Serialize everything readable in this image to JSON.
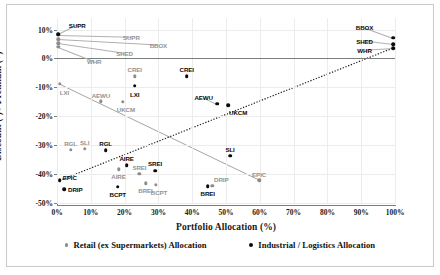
{
  "chart_data": {
    "type": "scatter",
    "title": "",
    "xlabel": "Portfolio Allocation (%)",
    "ylabel": "Discount (-) / Premium (+)",
    "xlim": [
      0,
      100
    ],
    "ylim": [
      -50,
      14
    ],
    "xticks": [
      "0%",
      "10%",
      "20%",
      "30%",
      "40%",
      "50%",
      "60%",
      "70%",
      "80%",
      "90%",
      "100%"
    ],
    "xtick_values": [
      0,
      10,
      20,
      30,
      40,
      50,
      60,
      70,
      80,
      90,
      100
    ],
    "yticks": [
      "10%",
      "0%",
      "-10%",
      "-20%",
      "-30%",
      "-40%",
      "-50%"
    ],
    "ytick_values": [
      10,
      0,
      -10,
      -20,
      -30,
      -40,
      -50
    ],
    "grid": true,
    "legend_position": "bottom",
    "series": [
      {
        "name": "Retail (ex Supermarkets) Allocation",
        "color": "#8c8c8c",
        "marker": "circle-grey",
        "points": [
          {
            "label": "SUPR",
            "x": 0.4,
            "y": 8.2,
            "lx": 22,
            "ly": 7.6
          },
          {
            "label": "BBOX",
            "x": 0.4,
            "y": 6.6,
            "lx": 30,
            "ly": 4.7
          },
          {
            "label": "SHED",
            "x": 0.4,
            "y": 5.2,
            "lx": 20,
            "ly": 1.8
          },
          {
            "label": "WHR",
            "x": 0.4,
            "y": 4.0,
            "lx": 11,
            "ly": -0.9
          },
          {
            "label": "LXI",
            "x": 0.8,
            "y": -8.8,
            "lx": 2.2,
            "ly": -11.6
          },
          {
            "label": "AEWU",
            "x": 13.0,
            "y": -14.8,
            "lx": 13.0,
            "ly": -12.5
          },
          {
            "label": "UKCM",
            "x": 19.4,
            "y": -15.0,
            "lx": 20.4,
            "ly": -17.6
          },
          {
            "label": "CREI",
            "x": 23.0,
            "y": -6.2,
            "lx": 23.0,
            "ly": -3.8
          },
          {
            "label": "RGL",
            "x": 4.0,
            "y": -31.7,
            "lx": 4.0,
            "ly": -29.3
          },
          {
            "label": "SLI",
            "x": 8.2,
            "y": -31.2,
            "lx": 8.2,
            "ly": -29.0
          },
          {
            "label": "AIRE",
            "x": 18.2,
            "y": -38.4,
            "lx": 18.2,
            "ly": -40.6
          },
          {
            "label": "SREI",
            "x": 24.4,
            "y": -39.8,
            "lx": 24.4,
            "ly": -37.6
          },
          {
            "label": "BREI",
            "x": 26.2,
            "y": -43.2,
            "lx": 26.2,
            "ly": -45.4
          },
          {
            "label": "BCPT",
            "x": 29.2,
            "y": -43.8,
            "lx": 30.2,
            "ly": -46.2
          },
          {
            "label": "DRIP",
            "x": 46.0,
            "y": -44.0,
            "lx": 48.6,
            "ly": -41.6
          },
          {
            "label": "EPIC",
            "x": 59.8,
            "y": -42.2,
            "lx": 59.8,
            "ly": -39.8
          }
        ]
      },
      {
        "name": "Industrial / Logistics Allocation",
        "color": "#0a0a0a",
        "marker": "circle-black",
        "points": [
          {
            "label": "SUPR",
            "x": 0.4,
            "y": 8.4,
            "lx": 6.0,
            "ly": 11.6
          },
          {
            "label": "BBOX",
            "x": 99.4,
            "y": 7.2,
            "lx": 91.0,
            "ly": 10.8
          },
          {
            "label": "SHED",
            "x": 99.4,
            "y": 5.0,
            "lx": 91.0,
            "ly": 6.2
          },
          {
            "label": "WHR",
            "x": 99.4,
            "y": 3.6,
            "lx": 91.0,
            "ly": 3.0
          },
          {
            "label": "LXI",
            "x": 23.0,
            "y": -9.4,
            "lx": 23.0,
            "ly": -12.2
          },
          {
            "label": "CREI",
            "x": 38.4,
            "y": -6.2,
            "lx": 38.4,
            "ly": -3.6
          },
          {
            "label": "AEWU",
            "x": 47.4,
            "y": -15.6,
            "lx": 43.4,
            "ly": -13.4
          },
          {
            "label": "UKCM",
            "x": 50.6,
            "y": -16.2,
            "lx": 53.6,
            "ly": -18.6
          },
          {
            "label": "RGL",
            "x": 14.4,
            "y": -31.8,
            "lx": 14.4,
            "ly": -29.2
          },
          {
            "label": "AIRE",
            "x": 20.6,
            "y": -37.0,
            "lx": 20.6,
            "ly": -34.5
          },
          {
            "label": "SREI",
            "x": 29.0,
            "y": -38.8,
            "lx": 29.0,
            "ly": -36.3
          },
          {
            "label": "EPIC",
            "x": 0.8,
            "y": -42.2,
            "lx": 3.8,
            "ly": -41.0
          },
          {
            "label": "DRIP",
            "x": 2.2,
            "y": -45.2,
            "lx": 5.4,
            "ly": -45.2
          },
          {
            "label": "BCPT",
            "x": 18.0,
            "y": -44.4,
            "lx": 18.0,
            "ly": -46.8
          },
          {
            "label": "BREI",
            "x": 44.6,
            "y": -44.2,
            "lx": 44.6,
            "ly": -46.6
          },
          {
            "label": "SLI",
            "x": 51.2,
            "y": -33.6,
            "lx": 51.2,
            "ly": -31.2
          }
        ]
      }
    ],
    "trendlines": [
      {
        "name": "retail-trend",
        "style": "solid",
        "color": "#9a9a9a",
        "x1": 0.6,
        "y1": -8.8,
        "x2": 60.0,
        "y2": -42.2
      },
      {
        "name": "industrial-trend",
        "style": "dotted",
        "color": "#222222",
        "x1": 0.8,
        "y1": -42.2,
        "x2": 99.4,
        "y2": 3.6
      }
    ],
    "zero_reference_line": 0
  },
  "legend": {
    "retail_label": "Retail (ex Supermarkets) Allocation",
    "industrial_label": "Industrial / Logistics Allocation"
  }
}
